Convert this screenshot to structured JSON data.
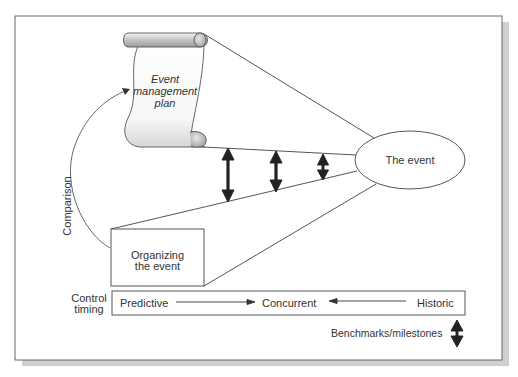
{
  "diagram": {
    "plan_label_line1": "Event",
    "plan_label_line2": "management",
    "plan_label_line3": "plan",
    "event_label": "The event",
    "organizing_line1": "Organizing",
    "organizing_line2": "the event",
    "comparison_label": "Comparison",
    "control_timing_line1": "Control",
    "control_timing_line2": "timing",
    "timing": {
      "predictive": "Predictive",
      "concurrent": "Concurrent",
      "historic": "Historic"
    },
    "legend_label": "Benchmarks/milestones"
  },
  "colors": {
    "line": "#555555",
    "arrow": "#222222",
    "shadow": "#c8c8c8",
    "scroll_shade": "#b5b5b5"
  }
}
